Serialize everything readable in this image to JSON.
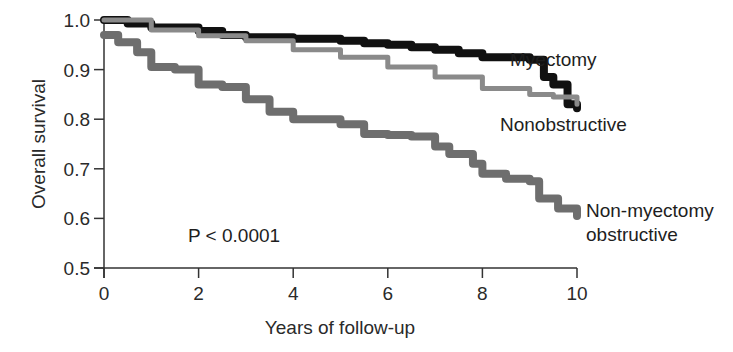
{
  "chart_data": {
    "type": "line",
    "subtype": "kaplan-meier step",
    "title": "",
    "xlabel": "Years of follow-up",
    "ylabel": "Overall survival",
    "xlim": [
      0,
      10
    ],
    "ylim": [
      0.5,
      1.0
    ],
    "x_ticks": [
      "0",
      "2",
      "4",
      "6",
      "8",
      "10"
    ],
    "y_ticks": [
      "0.5",
      "0.6",
      "0.7",
      "0.8",
      "0.9",
      "1.0"
    ],
    "grid": false,
    "legend": "inline labels at line ends",
    "annotations": [
      "P < 0.0001"
    ],
    "series": [
      {
        "name": "Myectomy",
        "color": "#111111",
        "points": [
          [
            0,
            1.0
          ],
          [
            0.5,
            0.993
          ],
          [
            1,
            0.985
          ],
          [
            2,
            0.978
          ],
          [
            2.5,
            0.97
          ],
          [
            3,
            0.965
          ],
          [
            4,
            0.962
          ],
          [
            5,
            0.958
          ],
          [
            5.5,
            0.953
          ],
          [
            6,
            0.95
          ],
          [
            6.5,
            0.945
          ],
          [
            7,
            0.94
          ],
          [
            7.5,
            0.933
          ],
          [
            8,
            0.925
          ],
          [
            9,
            0.92
          ],
          [
            9.3,
            0.885
          ],
          [
            9.5,
            0.87
          ],
          [
            9.8,
            0.83
          ],
          [
            10,
            0.822
          ]
        ]
      },
      {
        "name": "Nonobstructive",
        "color": "#8a8a8a",
        "points": [
          [
            0,
            1.0
          ],
          [
            1,
            0.98
          ],
          [
            2,
            0.968
          ],
          [
            3,
            0.958
          ],
          [
            4,
            0.94
          ],
          [
            5,
            0.925
          ],
          [
            6,
            0.905
          ],
          [
            7,
            0.885
          ],
          [
            8,
            0.862
          ],
          [
            9,
            0.85
          ],
          [
            9.5,
            0.845
          ],
          [
            10,
            0.83
          ]
        ]
      },
      {
        "name": "Non-myectomy obstructive",
        "color": "#6e6e6e",
        "points": [
          [
            0,
            0.97
          ],
          [
            0.3,
            0.955
          ],
          [
            0.7,
            0.935
          ],
          [
            1,
            0.905
          ],
          [
            1.5,
            0.9
          ],
          [
            2,
            0.87
          ],
          [
            2.5,
            0.865
          ],
          [
            3,
            0.84
          ],
          [
            3.5,
            0.815
          ],
          [
            4,
            0.8
          ],
          [
            5,
            0.79
          ],
          [
            5.5,
            0.77
          ],
          [
            6,
            0.768
          ],
          [
            6.5,
            0.765
          ],
          [
            7,
            0.745
          ],
          [
            7.3,
            0.73
          ],
          [
            7.8,
            0.71
          ],
          [
            8,
            0.69
          ],
          [
            8.5,
            0.68
          ],
          [
            9,
            0.675
          ],
          [
            9.2,
            0.64
          ],
          [
            9.6,
            0.62
          ],
          [
            10,
            0.605
          ]
        ]
      }
    ]
  },
  "labels": {
    "myectomy": "Myectomy",
    "nonobstructive": "Nonobstructive",
    "nonmyectomy_line1": "Non-myectomy",
    "nonmyectomy_line2": "obstructive",
    "pvalue": "P < 0.0001"
  }
}
